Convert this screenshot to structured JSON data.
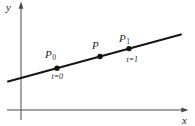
{
  "figure": {
    "background": "#ffffff",
    "axes": {
      "x_label": "x",
      "y_label": "y",
      "color": "#4a4a4a"
    },
    "line": {
      "color": "#161616",
      "x1": 8,
      "y1": 81.5,
      "x2": 181,
      "y2": 34.5
    },
    "points": [
      {
        "name": "P0",
        "label": "P",
        "subscript": "0",
        "t_label": "t=0",
        "cx": 57,
        "cy": 68.2
      },
      {
        "name": "P",
        "label": "P",
        "subscript": "",
        "t_label": "",
        "cx": 100,
        "cy": 56.5
      },
      {
        "name": "P1",
        "label": "P",
        "subscript": "1",
        "t_label": "t=1",
        "cx": 129,
        "cy": 48.6
      }
    ]
  }
}
